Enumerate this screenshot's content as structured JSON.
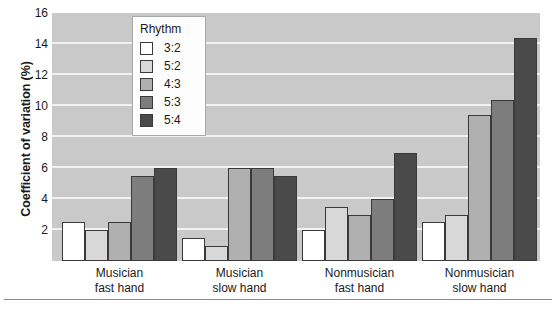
{
  "chart_data": {
    "type": "bar",
    "title": "",
    "xlabel": "",
    "ylabel": "Coefficient of variation (%)",
    "ylim": [
      0,
      16
    ],
    "yticks": [
      2,
      4,
      6,
      8,
      10,
      12,
      14,
      16
    ],
    "grid": true,
    "legend_position": "inside-top-left",
    "legend_title": "Rhythm",
    "categories": [
      "Musician\nfast hand",
      "Musician\nslow hand",
      "Nonmusician\nfast hand",
      "Nonmusician\nslow hand"
    ],
    "category_lines": [
      [
        "Musician",
        "fast hand"
      ],
      [
        "Musician",
        "slow hand"
      ],
      [
        "Nonmusician",
        "fast hand"
      ],
      [
        "Nonmusician",
        "slow hand"
      ]
    ],
    "series": [
      {
        "name": "3:2",
        "color": "#ffffff",
        "values": [
          2.5,
          1.5,
          2.0,
          2.5
        ]
      },
      {
        "name": "5:2",
        "color": "#d8d8d8",
        "values": [
          2.0,
          1.0,
          3.5,
          3.0
        ]
      },
      {
        "name": "4:3",
        "color": "#b0b0b0",
        "values": [
          2.5,
          6.0,
          3.0,
          9.4
        ]
      },
      {
        "name": "5:3",
        "color": "#7d7d7d",
        "values": [
          5.5,
          6.0,
          4.0,
          10.4
        ]
      },
      {
        "name": "5:4",
        "color": "#4a4a4a",
        "values": [
          6.0,
          5.5,
          7.0,
          14.4
        ]
      }
    ],
    "plot_background": "#c9c9c9",
    "gridline_color": "#f2f2f2"
  }
}
